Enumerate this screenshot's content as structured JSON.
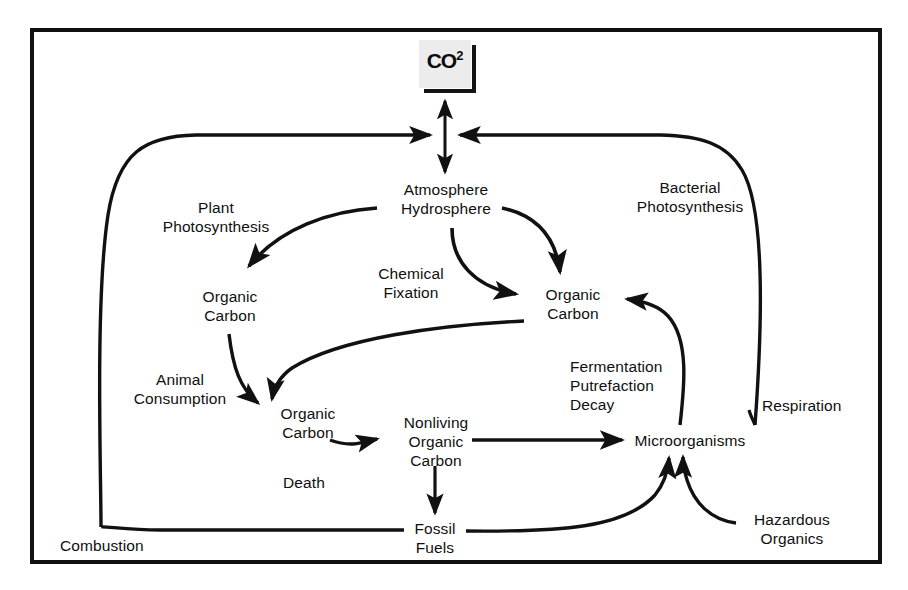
{
  "diagram": {
    "frame": {
      "border_color": "#111111"
    },
    "nodes": [
      {
        "id": "co2",
        "label": "CO2",
        "sup": "2",
        "box_fill": "#ececec"
      },
      {
        "id": "atmosphere",
        "label": "Atmosphere\nHydrosphere"
      },
      {
        "id": "organic-carbon-left",
        "label": "Organic\nCarbon"
      },
      {
        "id": "organic-carbon-right",
        "label": "Organic\nCarbon"
      },
      {
        "id": "organic-carbon-mid",
        "label": "Organic\nCarbon"
      },
      {
        "id": "nonliving-organic-carbon",
        "label": "Nonliving\nOrganic\nCarbon"
      },
      {
        "id": "microorganisms",
        "label": "Microorganisms"
      },
      {
        "id": "fossil-fuels",
        "label": "Fossil\nFuels"
      },
      {
        "id": "hazardous-organics",
        "label": "Hazardous\nOrganics"
      }
    ],
    "edge_labels": [
      {
        "id": "plant-photosynthesis",
        "label": "Plant\nPhotosynthesis"
      },
      {
        "id": "bacterial-photosynthesis",
        "label": "Bacterial\nPhotosynthesis"
      },
      {
        "id": "chemical-fixation",
        "label": "Chemical\nFixation"
      },
      {
        "id": "animal-consumption",
        "label": "Animal\nConsumption"
      },
      {
        "id": "fermentation-putrefaction-decay",
        "label": "Fermentation\nPutrefaction\nDecay"
      },
      {
        "id": "respiration",
        "label": "Respiration"
      },
      {
        "id": "death",
        "label": "Death"
      },
      {
        "id": "combustion",
        "label": "Combustion"
      }
    ],
    "stroke_color": "#111111"
  }
}
